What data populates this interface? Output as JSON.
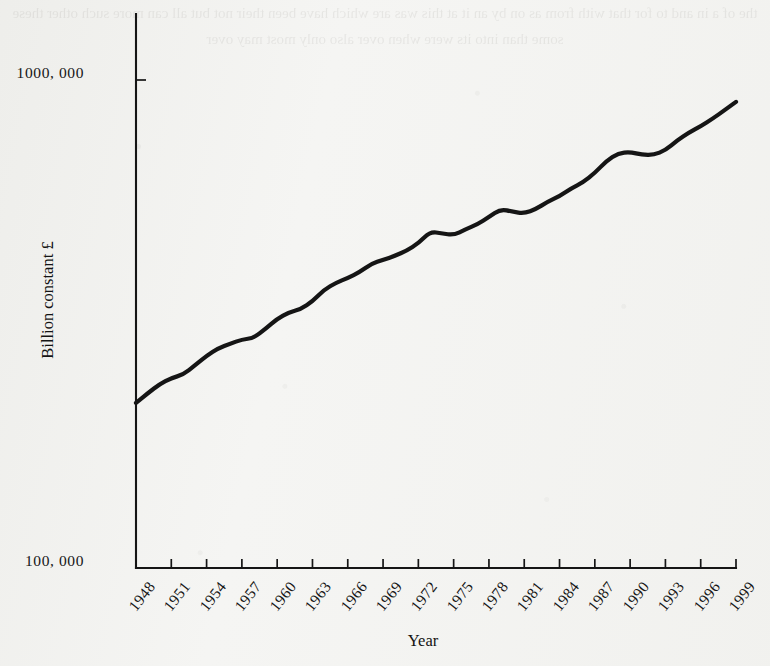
{
  "figure": {
    "background_color": "#f5f5f3",
    "ink_color": "#151515"
  },
  "bleed_through_text": "the of a in and to for that with from as on by an it at this was are which have been their not but all can more such other these some than into its were when over also only most may over",
  "chart_data": {
    "type": "line",
    "title": "",
    "subtitle": "",
    "xlabel": "Year",
    "ylabel": "Billion constant £",
    "yscale": "log",
    "grid": false,
    "legend": "none",
    "annotations": [],
    "xlim": [
      1948,
      1999
    ],
    "ylim": [
      100000,
      1900000
    ],
    "ytick_labels": [
      "100, 000",
      "1000, 000"
    ],
    "ytick_values": [
      100000,
      1000000
    ],
    "xtick_labels": [
      "1948",
      "1951",
      "1954",
      "1957",
      "1960",
      "1963",
      "1966",
      "1969",
      "1972",
      "1975",
      "1978",
      "1981",
      "1984",
      "1987",
      "1990",
      "1993",
      "1996",
      "1999"
    ],
    "xtick_values": [
      1948,
      1951,
      1954,
      1957,
      1960,
      1963,
      1966,
      1969,
      1972,
      1975,
      1978,
      1981,
      1984,
      1987,
      1990,
      1993,
      1996,
      1999
    ],
    "series": [
      {
        "name": "Billion constant £",
        "x": [
          1948,
          1949,
          1950,
          1951,
          1952,
          1953,
          1954,
          1955,
          1956,
          1957,
          1958,
          1959,
          1960,
          1961,
          1962,
          1963,
          1964,
          1965,
          1966,
          1967,
          1968,
          1969,
          1970,
          1971,
          1972,
          1973,
          1974,
          1975,
          1976,
          1977,
          1978,
          1979,
          1980,
          1981,
          1982,
          1983,
          1984,
          1985,
          1986,
          1987,
          1988,
          1989,
          1990,
          1991,
          1992,
          1993,
          1994,
          1995,
          1996,
          1997,
          1998,
          1999
        ],
        "values": [
          218000,
          228000,
          238000,
          245000,
          249000,
          260000,
          272000,
          282000,
          288000,
          294000,
          296000,
          309000,
          324000,
          334000,
          339000,
          352000,
          372000,
          384000,
          393000,
          404000,
          420000,
          428000,
          436000,
          447000,
          463000,
          489000,
          485000,
          481000,
          494000,
          506000,
          524000,
          544000,
          537000,
          533000,
          544000,
          563000,
          578000,
          600000,
          617000,
          645000,
          683000,
          708000,
          712000,
          703000,
          702000,
          718000,
          752000,
          780000,
          804000,
          833000,
          866000,
          902000
        ]
      }
    ]
  },
  "plot_geometry": {
    "x_axis_pixel_left": 136,
    "x_axis_pixel_right": 736,
    "baseline_pixel_y": 568,
    "upper_tick_pixel_y": 80,
    "tick_spacing_years": 3
  }
}
